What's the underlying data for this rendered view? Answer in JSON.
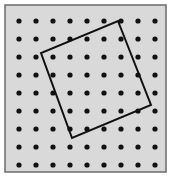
{
  "figure": {
    "kind": "geoboard-diagram",
    "canvas": {
      "width": 173,
      "height": 178
    },
    "frame": {
      "x": 5,
      "y": 5,
      "width": 161,
      "height": 167,
      "fill_color": "#d9d9d9",
      "stroke_color": "#6b6b6b",
      "stroke_width": 1.5
    },
    "lattice": {
      "rows": 9,
      "cols": 9,
      "origin_x": 19,
      "origin_y": 21,
      "spacing_x": 17.0,
      "spacing_y": 18.0,
      "dot_radius": 2.6,
      "dot_color": "#111111",
      "x_positions": [
        19,
        36,
        53,
        70,
        87,
        104,
        121,
        138,
        155
      ],
      "y_positions": [
        21,
        39,
        57,
        75,
        93,
        111,
        129,
        147,
        165
      ]
    },
    "polygon": {
      "name": "tilted-square",
      "sides": 4,
      "stroke_color": "#111111",
      "stroke_width": 2.0,
      "fill": "none",
      "vertices": [
        {
          "label": "top",
          "x": 118,
          "y": 21
        },
        {
          "label": "right",
          "x": 151,
          "y": 105
        },
        {
          "label": "bottom",
          "x": 72,
          "y": 138
        },
        {
          "label": "left",
          "x": 41,
          "y": 53
        }
      ],
      "points_attr": "118,21 151,105 72,138 41,53"
    }
  }
}
